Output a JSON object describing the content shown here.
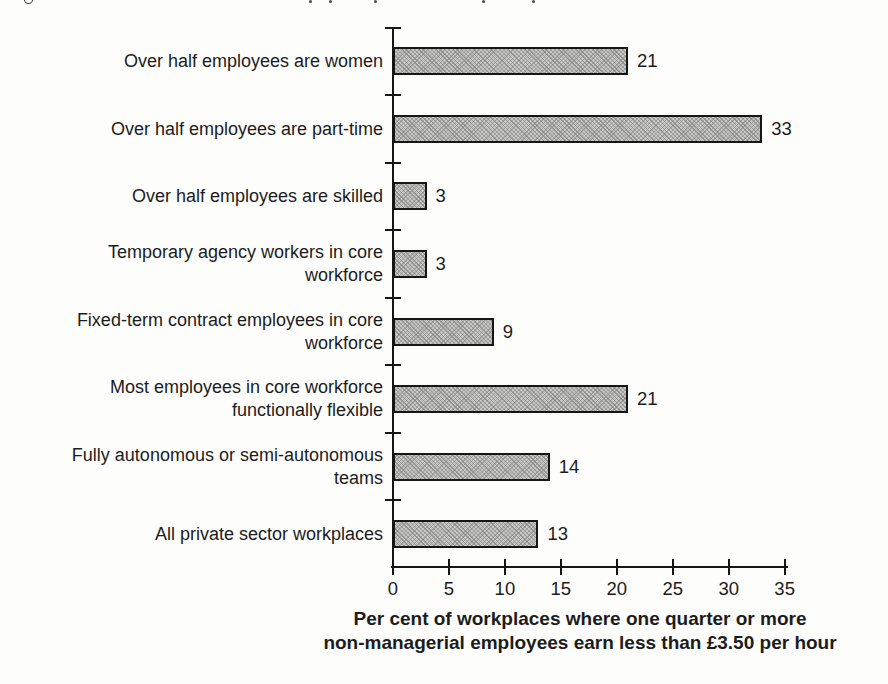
{
  "cropped_caption": {
    "fragments": [
      {
        "type": "loop",
        "x": 24
      },
      {
        "type": "dot",
        "x": 309
      },
      {
        "type": "dot",
        "x": 329
      },
      {
        "type": "dot",
        "x": 374
      },
      {
        "type": "dot",
        "x": 482
      },
      {
        "type": "dot",
        "x": 532
      }
    ]
  },
  "chart_data": {
    "type": "bar",
    "orientation": "horizontal",
    "categories": [
      "Over half employees are women",
      "Over half employees are part-time",
      "Over half employees are skilled",
      "Temporary agency workers in core\nworkforce",
      "Fixed-term contract employees in core\nworkforce",
      "Most employees in core workforce\nfunctionally flexible",
      "Fully autonomous or semi-autonomous\nteams",
      "All private sector workplaces"
    ],
    "values": [
      21,
      33,
      3,
      3,
      9,
      21,
      14,
      13
    ],
    "value_labels": [
      "21",
      "33",
      "3",
      "3",
      "9",
      "21",
      "14",
      "13"
    ],
    "xticks": [
      0,
      5,
      10,
      15,
      20,
      25,
      30,
      35
    ],
    "xlim": [
      0,
      35
    ],
    "xlabel": "Per cent of workplaces where one quarter or more\nnon-managerial employees earn less than £3.50 per hour",
    "grid": false,
    "legend": false,
    "bar_fill_color": "#c6c6c5",
    "bar_stipple_color": "#6e6e6e",
    "bar_border_color": "#161616",
    "axis_color": "#161616",
    "text_color": "#1c1c1c"
  }
}
